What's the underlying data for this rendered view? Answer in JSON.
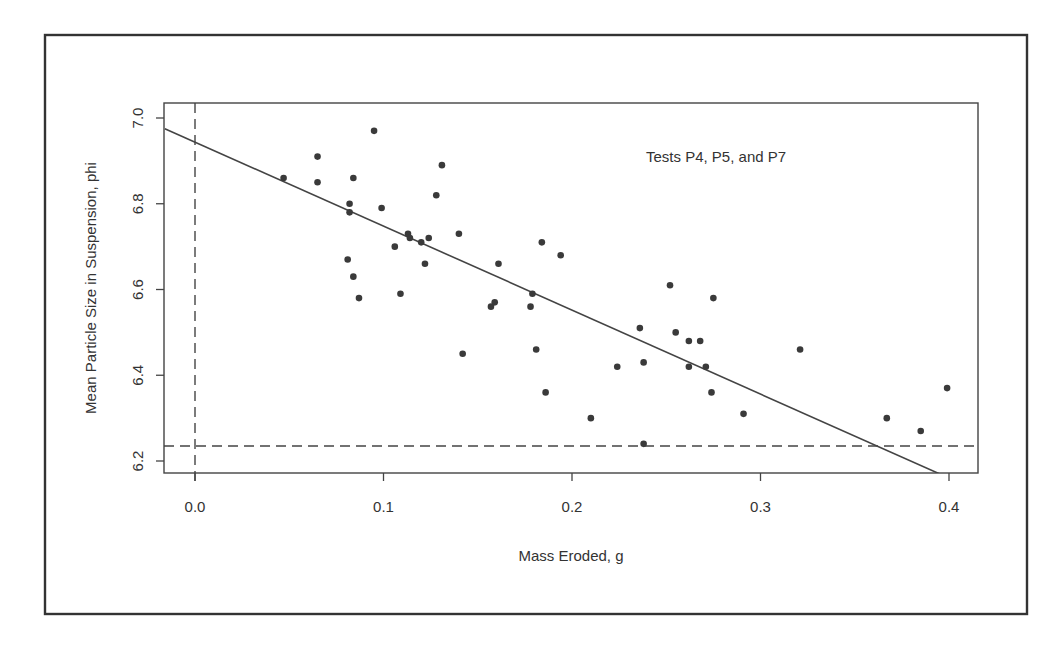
{
  "chart_data": {
    "type": "scatter",
    "title": "",
    "annotation": "Tests P4, P5, and P7",
    "xlabel": "Mass Eroded, g",
    "ylabel": "Mean Particle Size in Suspension, phi",
    "xlim": [
      -0.016,
      0.416
    ],
    "ylim": [
      6.17,
      7.035
    ],
    "x_ticks": [
      0.0,
      0.1,
      0.2,
      0.3,
      0.4
    ],
    "x_tick_labels": [
      "0.0",
      "0.1",
      "0.2",
      "0.3",
      "0.4"
    ],
    "y_ticks": [
      6.2,
      6.4,
      6.6,
      6.8,
      7.0
    ],
    "y_tick_labels": [
      "6.2",
      "6.4",
      "6.6",
      "6.8",
      "7.0"
    ],
    "grid": false,
    "legend": null,
    "series": [
      {
        "name": "Tests P4, P5, and P7",
        "marker": "filled-circle",
        "points": [
          {
            "x": 0.047,
            "y": 6.86
          },
          {
            "x": 0.065,
            "y": 6.91
          },
          {
            "x": 0.065,
            "y": 6.85
          },
          {
            "x": 0.081,
            "y": 6.67
          },
          {
            "x": 0.082,
            "y": 6.8
          },
          {
            "x": 0.082,
            "y": 6.78
          },
          {
            "x": 0.084,
            "y": 6.86
          },
          {
            "x": 0.084,
            "y": 6.63
          },
          {
            "x": 0.087,
            "y": 6.58
          },
          {
            "x": 0.095,
            "y": 6.97
          },
          {
            "x": 0.099,
            "y": 6.79
          },
          {
            "x": 0.106,
            "y": 6.7
          },
          {
            "x": 0.109,
            "y": 6.59
          },
          {
            "x": 0.113,
            "y": 6.73
          },
          {
            "x": 0.114,
            "y": 6.72
          },
          {
            "x": 0.12,
            "y": 6.71
          },
          {
            "x": 0.122,
            "y": 6.66
          },
          {
            "x": 0.124,
            "y": 6.72
          },
          {
            "x": 0.128,
            "y": 6.82
          },
          {
            "x": 0.131,
            "y": 6.89
          },
          {
            "x": 0.14,
            "y": 6.73
          },
          {
            "x": 0.142,
            "y": 6.45
          },
          {
            "x": 0.157,
            "y": 6.56
          },
          {
            "x": 0.159,
            "y": 6.57
          },
          {
            "x": 0.161,
            "y": 6.66
          },
          {
            "x": 0.178,
            "y": 6.56
          },
          {
            "x": 0.179,
            "y": 6.59
          },
          {
            "x": 0.181,
            "y": 6.46
          },
          {
            "x": 0.184,
            "y": 6.71
          },
          {
            "x": 0.186,
            "y": 6.36
          },
          {
            "x": 0.194,
            "y": 6.68
          },
          {
            "x": 0.21,
            "y": 6.3
          },
          {
            "x": 0.224,
            "y": 6.42
          },
          {
            "x": 0.236,
            "y": 6.51
          },
          {
            "x": 0.238,
            "y": 6.43
          },
          {
            "x": 0.238,
            "y": 6.24
          },
          {
            "x": 0.252,
            "y": 6.61
          },
          {
            "x": 0.255,
            "y": 6.5
          },
          {
            "x": 0.262,
            "y": 6.48
          },
          {
            "x": 0.262,
            "y": 6.42
          },
          {
            "x": 0.268,
            "y": 6.48
          },
          {
            "x": 0.271,
            "y": 6.42
          },
          {
            "x": 0.274,
            "y": 6.36
          },
          {
            "x": 0.275,
            "y": 6.58
          },
          {
            "x": 0.291,
            "y": 6.31
          },
          {
            "x": 0.321,
            "y": 6.46
          },
          {
            "x": 0.367,
            "y": 6.3
          },
          {
            "x": 0.385,
            "y": 6.27
          },
          {
            "x": 0.399,
            "y": 6.37
          }
        ]
      }
    ],
    "fit_line": {
      "type": "linear",
      "style": "solid",
      "x": [
        -0.016,
        0.395
      ],
      "y": [
        6.975,
        6.17
      ],
      "intercept": 6.944,
      "slope": -1.95
    },
    "reference_lines": [
      {
        "orientation": "vertical",
        "value": 0.0,
        "style": "dashed"
      },
      {
        "orientation": "horizontal",
        "value": 6.235,
        "style": "dashed"
      }
    ]
  },
  "layout": {
    "frame": {
      "x": 45,
      "y": 35,
      "w": 982,
      "h": 579
    },
    "plot": {
      "x": 164,
      "y": 103,
      "w": 814,
      "h": 370
    },
    "x_px": {
      "v0": 0.0,
      "p0": 195,
      "v1": 0.4,
      "p1": 949
    },
    "y_px": {
      "v0": 7.0,
      "p0": 118,
      "v1": 6.2,
      "p1": 461
    }
  }
}
